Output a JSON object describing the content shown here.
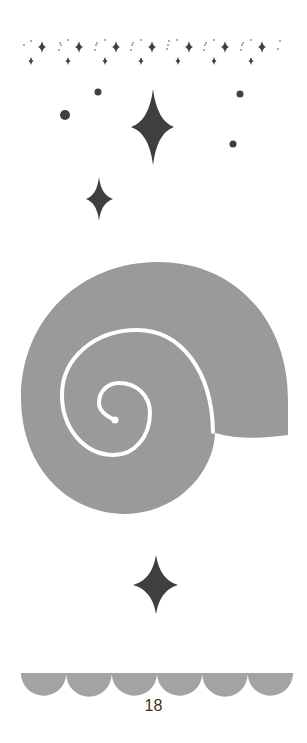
{
  "page": {
    "page_number": "18",
    "colors": {
      "background": "#ffffff",
      "star": "#3f3f3f",
      "shell": "#9a9a9a",
      "spiral_line": "#ffffff",
      "scallop": "#a3a3a3",
      "dots_light": "#9c9c9c",
      "text": "#333333"
    }
  },
  "decorations": {
    "top_border": {
      "pattern": "sparkle-stars-and-dots",
      "big_star_x": [
        42,
        79,
        116,
        152,
        189,
        225,
        262
      ],
      "small_star_x": [
        31,
        68,
        105,
        141,
        178,
        214,
        251
      ]
    },
    "sparkles": [
      {
        "type": "big-star",
        "cx": 153,
        "cy": 127,
        "w": 43,
        "h": 76
      },
      {
        "type": "small-star",
        "cx": 99,
        "cy": 199,
        "w": 27,
        "h": 44
      },
      {
        "type": "star-bottom",
        "cx": 156,
        "cy": 585,
        "w": 45,
        "h": 60
      }
    ],
    "dots": [
      {
        "cx": 65,
        "cy": 115,
        "r": 5
      },
      {
        "cx": 98,
        "cy": 92,
        "r": 3.5
      },
      {
        "cx": 240,
        "cy": 94,
        "r": 3.5
      },
      {
        "cx": 233,
        "cy": 144,
        "r": 3.5
      }
    ],
    "shell": {
      "type": "nautilus-spiral-shell"
    },
    "bottom_border": {
      "type": "scallops",
      "count": 6
    }
  }
}
